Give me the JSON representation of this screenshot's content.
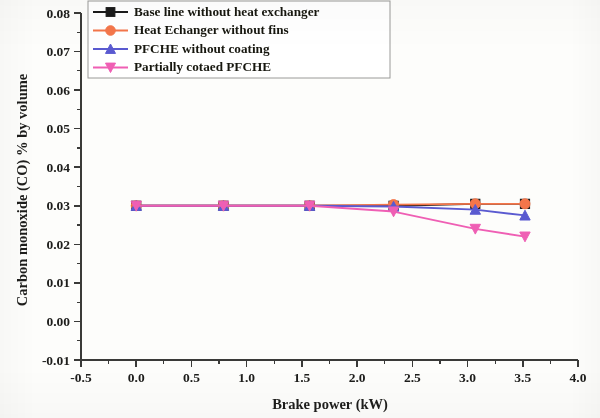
{
  "chart_data": {
    "type": "line",
    "title": "",
    "xlabel": "Brake power (kW)",
    "ylabel": "Carbon monoxide (CO) % by volume",
    "xlim": [
      -0.5,
      4.0
    ],
    "ylim": [
      -0.01,
      0.08
    ],
    "xticks": [
      "-0.5",
      "0.0",
      "0.5",
      "1.0",
      "1.5",
      "2.0",
      "2.5",
      "3.0",
      "3.5",
      "4.0"
    ],
    "xtick_values": [
      -0.5,
      0.0,
      0.5,
      1.0,
      1.5,
      2.0,
      2.5,
      3.0,
      3.5,
      4.0
    ],
    "yticks": [
      "0.08",
      "0.07",
      "0.06",
      "0.05",
      "0.04",
      "0.03",
      "0.02",
      "0.01",
      "0.00",
      "-0.01"
    ],
    "ytick_values": [
      0.08,
      0.07,
      0.06,
      0.05,
      0.04,
      0.03,
      0.02,
      0.01,
      0.0,
      -0.01
    ],
    "grid": false,
    "legend_position": "top-left",
    "x": [
      0.0,
      0.79,
      1.57,
      2.33,
      3.07,
      3.52
    ],
    "series": [
      {
        "name": "Base line without heat exchanger",
        "color": "#1a1a1a",
        "marker": "square",
        "values": [
          0.03,
          0.03,
          0.03,
          0.03,
          0.0305,
          0.0305
        ]
      },
      {
        "name": "Heat Echanger without fins",
        "color": "#f4764a",
        "marker": "circle",
        "values": [
          0.03,
          0.03,
          0.03,
          0.0303,
          0.0305,
          0.0305
        ]
      },
      {
        "name": "PFCHE without coating",
        "color": "#5a5ad0",
        "marker": "triangle-up",
        "values": [
          0.03,
          0.03,
          0.03,
          0.0298,
          0.029,
          0.0275
        ]
      },
      {
        "name": "Partially cotaed PFCHE",
        "color": "#ef5fb4",
        "marker": "triangle-down",
        "values": [
          0.03,
          0.03,
          0.03,
          0.0285,
          0.024,
          0.022
        ]
      }
    ]
  },
  "legend": {
    "items": [
      {
        "label": "Base line without heat exchanger"
      },
      {
        "label": "Heat Echanger without fins"
      },
      {
        "label": "PFCHE without coating"
      },
      {
        "label": "Partially cotaed PFCHE"
      }
    ]
  },
  "axes": {
    "x_title": "Brake power (kW)",
    "y_title": "Carbon monoxide (CO) % by volume"
  }
}
